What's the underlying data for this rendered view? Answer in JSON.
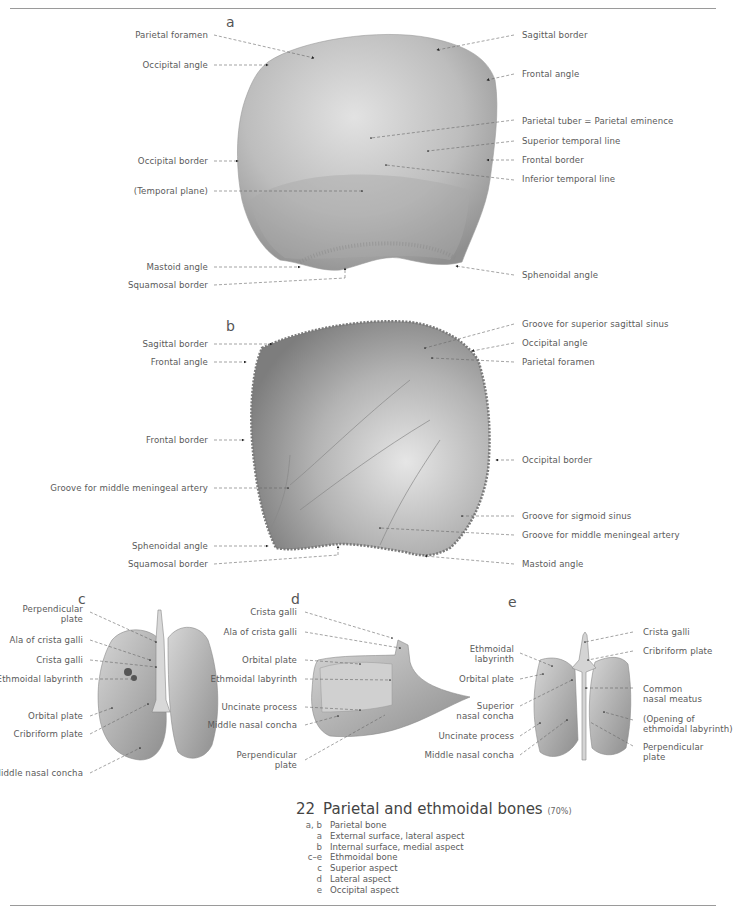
{
  "figure": {
    "number": "22",
    "title": "Parietal and ethmoidal bones",
    "scale": "(70%)",
    "legend": [
      {
        "key": "a, b",
        "text": "Parietal bone"
      },
      {
        "key": "a",
        "text": "External surface, lateral aspect"
      },
      {
        "key": "b",
        "text": "Internal surface, medial aspect"
      },
      {
        "key": "c–e",
        "text": "Ethmoidal bone"
      },
      {
        "key": "c",
        "text": "Superior aspect"
      },
      {
        "key": "d",
        "text": "Lateral aspect"
      },
      {
        "key": "e",
        "text": "Occipital aspect"
      }
    ]
  },
  "panel_a": {
    "letter": "a",
    "left_labels": [
      "Parietal foramen",
      "Occipital angle",
      "Occipital border",
      "(Temporal plane)",
      "Mastoid angle",
      "Squamosal border"
    ],
    "right_labels": [
      "Sagittal border",
      "Frontal angle",
      "Parietal tuber = Parietal eminence",
      "Superior temporal line",
      "Frontal border",
      "Inferior temporal line",
      "Sphenoidal angle"
    ]
  },
  "panel_b": {
    "letter": "b",
    "left_labels": [
      "Sagittal border",
      "Frontal angle",
      "Frontal border",
      "Groove for middle meningeal artery",
      "Sphenoidal angle",
      "Squamosal border"
    ],
    "right_labels": [
      "Groove for superior sagittal sinus",
      "Occipital angle",
      "Parietal foramen",
      "Occipital border",
      "Groove for sigmoid sinus",
      "Groove for middle meningeal artery",
      "Mastoid angle"
    ]
  },
  "panel_c": {
    "letter": "c",
    "labels": [
      "Perpendicular plate",
      "Ala of crista galli",
      "Crista galli",
      "Ethmoidal labyrinth",
      "Orbital plate",
      "Cribriform plate",
      "Middle nasal concha"
    ]
  },
  "panel_d": {
    "letter": "d",
    "labels": [
      "Crista galli",
      "Ala of crista galli",
      "Orbital plate",
      "Ethmoidal labyrinth",
      "Uncinate process",
      "Middle nasal concha",
      "Perpendicular plate"
    ]
  },
  "panel_e": {
    "letter": "e",
    "left_labels": [
      "Ethmoidal labyrinth",
      "Orbital plate",
      "Superior nasal concha",
      "Uncinate process",
      "Middle nasal concha"
    ],
    "right_labels": [
      "Crista galli",
      "Cribriform plate",
      "Common nasal meatus",
      "(Opening of ethmoidal labyrinth)",
      "Perpendicular plate"
    ]
  }
}
